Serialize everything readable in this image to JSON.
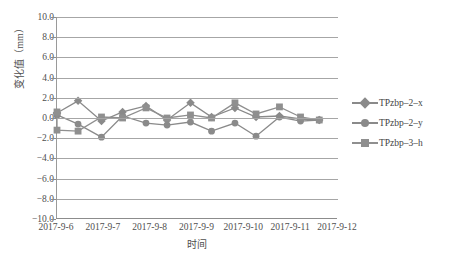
{
  "chart": {
    "type": "line",
    "y_axis_title": "变化值（mm）",
    "x_axis_title": "时间"
  },
  "yticks": [
    {
      "label": "10.0",
      "value": 10
    },
    {
      "label": "8.0",
      "value": 8
    },
    {
      "label": "6.0",
      "value": 6
    },
    {
      "label": "4.0",
      "value": 4
    },
    {
      "label": "2.0",
      "value": 2
    },
    {
      "label": "0.0",
      "value": 0
    },
    {
      "label": "-2.0",
      "value": -2
    },
    {
      "label": "-4.0",
      "value": -4
    },
    {
      "label": "-6.0",
      "value": -6
    },
    {
      "label": "-8.0",
      "value": -8
    },
    {
      "label": "-10.0",
      "value": -10
    }
  ],
  "xticks": [
    {
      "label": "2017-9-6",
      "value": 0
    },
    {
      "label": "2017-9-7",
      "value": 1
    },
    {
      "label": "2017-9-8",
      "value": 2
    },
    {
      "label": "2017-9-9",
      "value": 3
    },
    {
      "label": "2017-9-10",
      "value": 4
    },
    {
      "label": "2017-9-11",
      "value": 5
    },
    {
      "label": "2017-9-12",
      "value": 6
    }
  ],
  "legend": {
    "position": "right",
    "items": [
      {
        "label": "TPzbp-2-x",
        "marker": "diamond",
        "color": "#8a8a8a"
      },
      {
        "label": "TPzbp-2-y",
        "marker": "circle",
        "color": "#8a8a8a"
      },
      {
        "label": "TPzbp-3-h",
        "marker": "square",
        "color": "#8f8f8f"
      }
    ]
  },
  "chart_data": {
    "type": "line",
    "title": "",
    "xlabel": "时间",
    "ylabel": "变化值（mm）",
    "xlim": [
      0,
      6
    ],
    "ylim": [
      -10,
      10
    ],
    "grid": true,
    "legend_position": "right",
    "x_tick_labels": [
      "2017-9-6",
      "2017-9-7",
      "2017-9-8",
      "2017-9-9",
      "2017-9-10",
      "2017-9-11",
      "2017-9-12"
    ],
    "y_tick_labels": [
      "10.0",
      "8.0",
      "6.0",
      "4.0",
      "2.0",
      "0.0",
      "-2.0",
      "-4.0",
      "-6.0",
      "-8.0",
      "-10.0"
    ],
    "x": [
      0.0,
      0.0,
      0.45,
      0.95,
      1.4,
      1.9,
      2.35,
      2.85,
      3.3,
      3.8,
      4.25,
      4.75,
      5.2,
      5.6
    ],
    "series": [
      {
        "name": "TPzbp-2-x",
        "marker": "diamond",
        "color": "#8a8a8a",
        "values": [
          0.5,
          0.5,
          1.7,
          -0.3,
          0.6,
          1.2,
          -0.2,
          1.5,
          0.1,
          1.0,
          0.1,
          0.2,
          -0.1,
          -0.2
        ]
      },
      {
        "name": "TPzbp-2-y",
        "marker": "circle",
        "color": "#8a8a8a",
        "values": [
          0.3,
          0.3,
          -0.6,
          -1.9,
          0.2,
          -0.5,
          -0.7,
          -0.4,
          -1.3,
          -0.5,
          -1.8,
          0.1,
          -0.3,
          -0.2
        ]
      },
      {
        "name": "TPzbp-3-h",
        "marker": "square",
        "color": "#8f8f8f",
        "values": [
          0.6,
          -1.2,
          -1.3,
          0.1,
          0.0,
          1.0,
          0.0,
          0.3,
          0.0,
          1.5,
          0.4,
          1.1,
          0.1,
          -0.2
        ]
      }
    ]
  }
}
